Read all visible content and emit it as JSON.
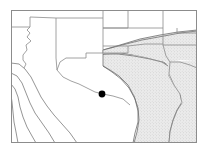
{
  "figure": {
    "type": "distribution-map",
    "title": "",
    "caption": "",
    "canvas": {
      "width": 208,
      "height": 160,
      "background": "#ffffff"
    }
  },
  "frame": {
    "x": 11,
    "y": 10,
    "width": 186,
    "height": 133,
    "stroke": "#8c8c8c",
    "stroke_width": 1,
    "fill": "#ffffff"
  },
  "style": {
    "boundary_stroke": "#8a8a8a",
    "boundary_stroke_thin": "#9a9a9a",
    "boundary_width": 0.8,
    "range_fill": "#e3e3e3",
    "range_stipple": "#c9c9c9",
    "range_edge": "#6e6e6e",
    "marker_fill": "#000000",
    "water_stroke": "#7a7a7a"
  },
  "region_extent": {
    "description": "United States southwest and south central region with northern Mexico",
    "states_depicted": [
      "Arizona",
      "Utah",
      "Colorado",
      "New Mexico",
      "Kansas",
      "Oklahoma",
      "Texas",
      "Arkansas",
      "Louisiana",
      "Missouri"
    ]
  },
  "shaded_range": {
    "label": "",
    "fill": "#e3e3e3",
    "covers": [
      "eastern Texas",
      "eastern Oklahoma",
      "Arkansas",
      "Louisiana",
      "southern Missouri"
    ]
  },
  "markers": [
    {
      "id": "locality-1",
      "x": 102,
      "y": 94,
      "radius": 3.4,
      "fill": "#000000",
      "label": ""
    }
  ],
  "boundaries": {
    "state_paths": [
      "M 11 27 L 30 27 L 30 17 L 55 18",
      "M 30 27 L 26 30 L 30 34 L 27 38 L 31 42 L 25 47 L 26 53 L 22 58 L 22 62 L 26 65",
      "M 55 18 L 56 72 L 60 72",
      "M 55 18 L 103 18 L 103 11",
      "M 103 11 L 103 28 L 128 28 L 128 11",
      "M 128 28 L 163 28 L 163 11",
      "M 163 28 L 163 46 L 197 46",
      "M 197 32 L 177 32 L 177 28",
      "M 103 28 L 103 46 L 128 46",
      "M 128 46 L 128 53 L 103 53",
      "M 103 53 L 86 53 L 86 58 L 66 58 L 60 63 L 56 72",
      "M 128 46 L 163 46",
      "M 163 46 L 165 58 L 172 62 L 180 62 L 186 66 L 190 72 L 197 74",
      "M 172 62 L 170 78 L 174 88 L 180 94 L 182 104",
      "M 182 104 L 176 112 L 172 122 L 170 132 L 168 143"
    ],
    "international_paths": [
      "M 11 64 L 18 64 L 24 68 L 30 76 L 34 86 L 38 96 L 44 104 L 50 112 L 58 120 L 66 128 L 74 136 L 80 143",
      "M 11 74 L 16 76 L 21 82 L 25 92 L 28 102 L 33 112 L 40 122 L 48 132 L 54 143",
      "M 11 84 L 14 88 L 17 96 L 19 106 L 22 116 L 26 126 L 31 136 L 35 143",
      "M 11 94 L 12 100 L 13 110 L 14 120 L 16 130 L 18 143"
    ],
    "coast_and_range_paths": [
      "M 56 72 L 62 78 L 70 82 L 78 84 L 86 88 L 94 92 L 102 94 L 112 96 L 122 98 L 130 104 L 136 114 L 138 124 L 136 134 L 132 143"
    ]
  }
}
